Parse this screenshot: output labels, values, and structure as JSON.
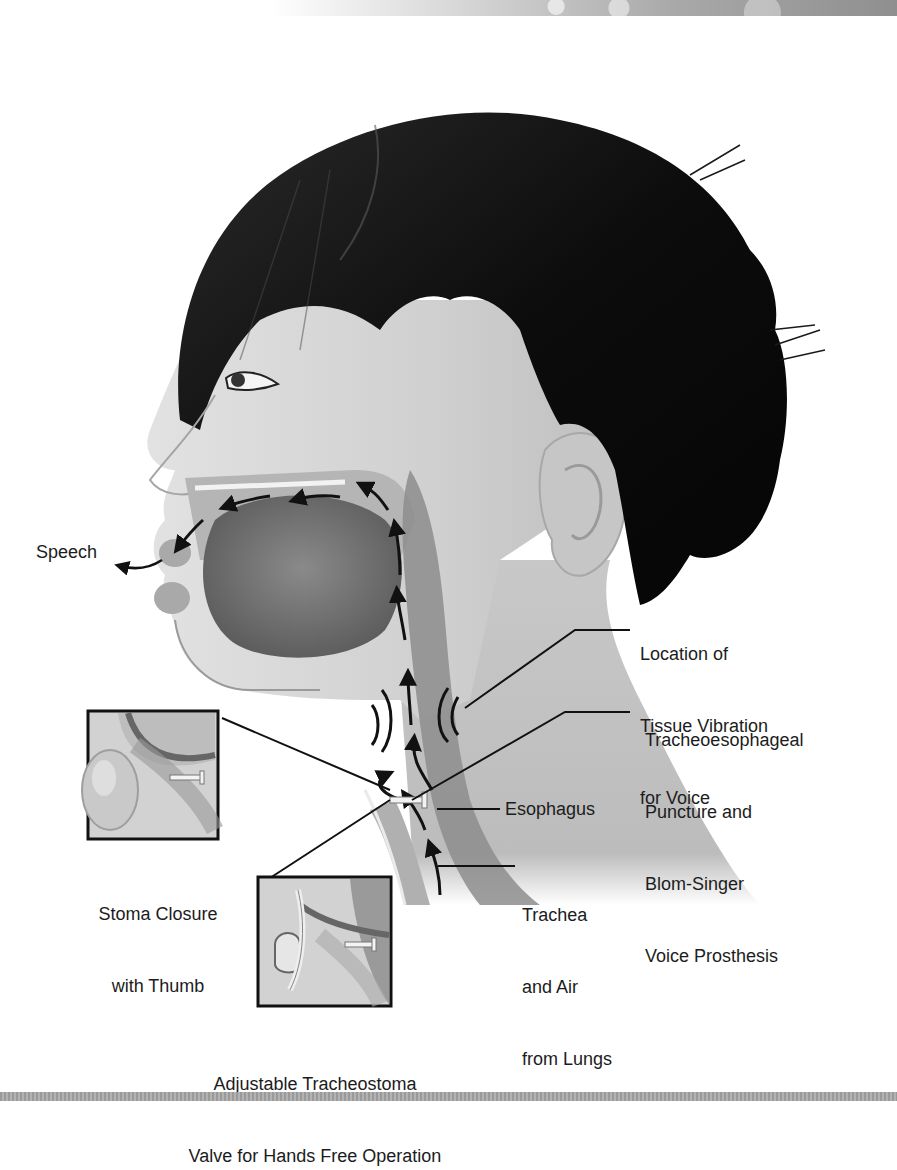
{
  "figure": {
    "labels": {
      "speech": "Speech",
      "tissue_vibration": [
        "Location of",
        "Tissue Vibration",
        "for Voice"
      ],
      "puncture": [
        "Tracheoesophageal",
        "Puncture and",
        "Blom-Singer",
        "Voice Prosthesis"
      ],
      "esophagus": "Esophagus",
      "trachea": [
        "Trachea",
        "and Air",
        "from Lungs"
      ],
      "stoma_closure": [
        "Stoma Closure",
        "with Thumb"
      ],
      "valve": [
        "Adjustable Tracheostoma",
        "Valve for Hands Free Operation"
      ]
    },
    "insets": [
      {
        "name": "stoma-closure-inset",
        "depicts": "thumb occluding stoma"
      },
      {
        "name": "tracheostoma-valve-inset",
        "depicts": "adjustable tracheostoma valve"
      }
    ],
    "colors": {
      "hair": "#0d0d0d",
      "skin": "#d6d6d6",
      "tissue_dark": "#6e6e6e",
      "line": "#111111",
      "background": "#ffffff"
    }
  }
}
